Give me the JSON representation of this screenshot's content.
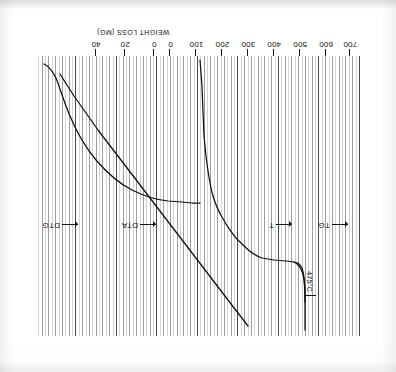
{
  "figure": {
    "orientation": "rotated-180",
    "kind": "thermal-analysis-recorder-trace",
    "ink_color": "#111111",
    "grid_color": "#4a4a4a"
  },
  "axis": {
    "title": "WEIGHT LOSS (MG)",
    "tick_labels": [
      "700",
      "600",
      "500",
      "400",
      "300",
      "200",
      "100",
      "0",
      "0",
      "20",
      "40"
    ],
    "temperature_labels": [
      "700",
      "600",
      "500",
      "400",
      "300",
      "200",
      "100",
      "0"
    ],
    "weight_labels": [
      "0",
      "20",
      "40"
    ]
  },
  "curve_labels": [
    {
      "name": "DTG",
      "text": "DTG"
    },
    {
      "name": "DTA",
      "text": "DTA"
    },
    {
      "name": "T",
      "text": "T"
    },
    {
      "name": "TG",
      "text": "TG"
    }
  ],
  "annotations": [
    {
      "name": "dta-peak-temperature",
      "text": "475°C"
    }
  ],
  "chart_data": {
    "type": "line",
    "title": "",
    "subtitle": "",
    "xlabel": "WEIGHT LOSS (MG)",
    "ylabel": "",
    "xlim": [
      -40,
      700
    ],
    "grid": true,
    "legend": "inline-arrow-labels",
    "x_ticks": [
      700,
      600,
      500,
      400,
      300,
      200,
      100,
      0,
      -20,
      -40
    ],
    "x_tick_labels": [
      "700",
      "600",
      "500",
      "400",
      "300",
      "200",
      "100",
      "0",
      "20",
      "40"
    ],
    "series": [
      {
        "name": "T",
        "label": "T",
        "description": "linear temperature programme ramp",
        "x": [
          0,
          100,
          200,
          300,
          400,
          500,
          600,
          700
        ],
        "y": [
          0,
          14,
          28,
          42,
          56,
          70,
          84,
          98
        ]
      },
      {
        "name": "TG",
        "label": "TG",
        "description": "thermogravimetric weight-loss trace",
        "x": [
          0,
          50,
          100,
          150,
          200,
          250,
          300,
          350,
          400,
          450,
          480,
          500,
          550,
          600,
          700
        ],
        "y": [
          0,
          1,
          3,
          7,
          13,
          20,
          27,
          33,
          38,
          42,
          44,
          45,
          45,
          45,
          45
        ]
      },
      {
        "name": "DTG",
        "label": "DTG",
        "description": "derivative thermogravimetry baseline with step",
        "x": [
          0,
          100,
          200,
          300,
          380,
          430,
          470,
          500,
          560,
          620,
          700
        ],
        "y": [
          0,
          0,
          0,
          1,
          3,
          6,
          9,
          6,
          2,
          0,
          0
        ]
      },
      {
        "name": "DTA",
        "label": "DTA",
        "description": "differential thermal analysis with sharp exotherm",
        "peak_temperature_c": 475,
        "x": [
          0,
          150,
          300,
          400,
          450,
          470,
          475,
          480,
          500,
          540,
          600,
          700
        ],
        "y": [
          0,
          1,
          3,
          8,
          20,
          48,
          62,
          48,
          18,
          6,
          2,
          1
        ]
      }
    ],
    "annotations": [
      {
        "text": "475°C",
        "x": 475,
        "y": 62,
        "series": "DTA"
      }
    ]
  }
}
